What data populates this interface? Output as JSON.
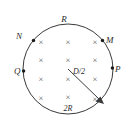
{
  "figure": {
    "geometry": {
      "circle_center_x": 68,
      "circle_center_y": 69,
      "circle_radius": 45,
      "field_symbol": "×",
      "field_direction": "into-page"
    },
    "labels": {
      "top": "R",
      "bottom": "2R",
      "left_upper": "N",
      "left_middle": "Q",
      "right_upper": "M",
      "right_middle": "P",
      "radius_arrow": "D/2"
    },
    "nodes": [
      {
        "name": "N",
        "x": 33,
        "y": 40
      },
      {
        "name": "M",
        "x": 103,
        "y": 40
      },
      {
        "name": "Q",
        "x": 24,
        "y": 70
      },
      {
        "name": "P",
        "x": 112,
        "y": 69
      }
    ],
    "field_marks": [
      {
        "x": 41,
        "y": 42
      },
      {
        "x": 68,
        "y": 42
      },
      {
        "x": 95,
        "y": 42
      },
      {
        "x": 41,
        "y": 60
      },
      {
        "x": 68,
        "y": 60
      },
      {
        "x": 95,
        "y": 60
      },
      {
        "x": 41,
        "y": 79
      },
      {
        "x": 68,
        "y": 79
      },
      {
        "x": 95,
        "y": 79
      },
      {
        "x": 41,
        "y": 98
      },
      {
        "x": 68,
        "y": 97
      },
      {
        "x": 95,
        "y": 99
      }
    ],
    "radius_arrow": {
      "from_x": 68,
      "from_y": 69,
      "to_x": 101,
      "to_y": 101
    },
    "colors": {
      "stroke": "#3a3a3a",
      "text": "#2b2b2b",
      "field_mark": "#555555",
      "background": "#ffffff"
    }
  }
}
